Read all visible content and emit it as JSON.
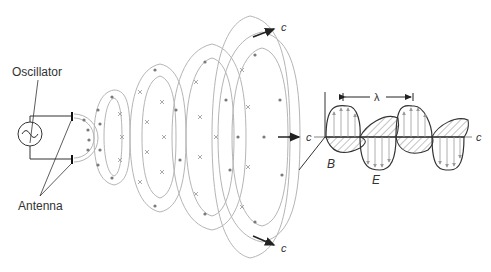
{
  "labels": {
    "oscillator": "Oscillator",
    "antenna": "Antenna",
    "speed_top": "c",
    "speed_bottom": "c",
    "speed_axis_left": "c",
    "speed_axis_right": "c",
    "wavelength": "λ",
    "magnetic_field": "B",
    "electric_field": "E"
  },
  "colors": {
    "line_dark": "#333333",
    "line_field": "#9a9a9a",
    "dot": "#7a7a7a",
    "cross": "#9a9a9a",
    "background": "#ffffff"
  },
  "icons": {
    "oscillator_symbol": "sine-wave-in-circle",
    "field_out_of_page": "dot",
    "field_into_page": "cross",
    "propagation": "arrow"
  }
}
